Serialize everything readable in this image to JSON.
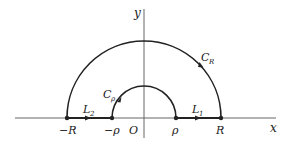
{
  "diagram": {
    "colors": {
      "axis": "#555555",
      "contour": "#222222",
      "text": "#1a1a1a",
      "background": "#ffffff"
    },
    "axes": {
      "x_label": "x",
      "y_label": "y",
      "origin_label": "O"
    },
    "points": [
      {
        "id": "neg-R",
        "label": "−R"
      },
      {
        "id": "neg-rho",
        "label": "−ρ"
      },
      {
        "id": "rho",
        "label": "ρ"
      },
      {
        "id": "R",
        "label": "R"
      }
    ],
    "contours": {
      "outer_arc": {
        "label_main": "C",
        "label_sub": "R"
      },
      "inner_arc": {
        "label_main": "C",
        "label_sub": "ρ"
      },
      "segment_right": {
        "label_main": "L",
        "label_sub": "1"
      },
      "segment_left": {
        "label_main": "L",
        "label_sub": "2"
      }
    }
  }
}
